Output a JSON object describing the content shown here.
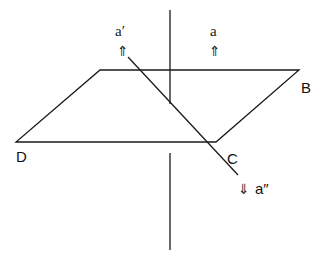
{
  "diagram": {
    "type": "geometry-plane-with-lines",
    "plane": {
      "vertices": {
        "A": {
          "x": 100,
          "y": 70,
          "label": ""
        },
        "B": {
          "x": 299,
          "y": 70,
          "label": "B"
        },
        "C": {
          "x": 216,
          "y": 142,
          "label": "C"
        },
        "D": {
          "x": 16,
          "y": 142,
          "label": "D"
        }
      }
    },
    "labels": {
      "B": "B",
      "C": "C",
      "D": "D",
      "a": "a",
      "a_prime": "a′",
      "a_double_prime": "a″"
    },
    "arrows": {
      "up": "⇑",
      "down": "⇓"
    },
    "lines": {
      "vertical_upper": {
        "x": 170,
        "y1": 10,
        "y2": 104
      },
      "vertical_lower": {
        "x": 170,
        "y1": 153,
        "y2": 250
      },
      "oblique": {
        "x1": 128,
        "y1": 57,
        "x2": 238,
        "y2": 175
      }
    },
    "colors": {
      "stroke": "#1a1a1a",
      "background": "#ffffff"
    }
  }
}
